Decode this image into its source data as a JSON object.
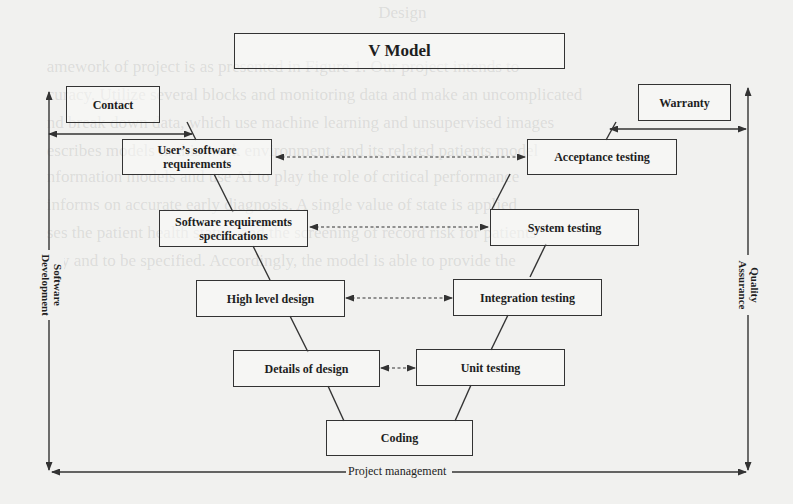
{
  "diagram": {
    "title": "V Model",
    "side_labels": {
      "left_line1": "Software",
      "left_line2": "Development",
      "right_line1": "Quality",
      "right_line2": "Assurance",
      "bottom": "Project management"
    },
    "external_boxes": {
      "contact": "Contact",
      "warranty": "Warranty"
    },
    "left_branch": [
      {
        "label_line1": "User’s software",
        "label_line2": "requirements"
      },
      {
        "label_line1": "Software requirements",
        "label_line2": "specifications"
      },
      {
        "label_line1": "High level design",
        "label_line2": ""
      },
      {
        "label_line1": "Details of design",
        "label_line2": ""
      }
    ],
    "bottom_node": "Coding",
    "right_branch": [
      {
        "label": "Acceptance testing"
      },
      {
        "label": "System testing"
      },
      {
        "label": "Integration testing"
      },
      {
        "label": "Unit testing"
      }
    ],
    "connections": [
      {
        "from": "User’s software requirements",
        "to": "Acceptance testing",
        "style": "dashed-bidirectional"
      },
      {
        "from": "Software requirements specifications",
        "to": "System testing",
        "style": "dashed-bidirectional"
      },
      {
        "from": "High level design",
        "to": "Integration testing",
        "style": "dashed-bidirectional"
      },
      {
        "from": "Details of design",
        "to": "Unit testing",
        "style": "dashed-bidirectional"
      }
    ],
    "colors": {
      "line": "#333333",
      "background": "#f1f1ef",
      "text": "#1e1e1e"
    }
  },
  "background_text": {
    "lines": [
      "                                                                                         Design",
      "",
      "           amework of project is as presented in Figure 1. Our project intends to",
      "           curacy. Utilize several blocks and monitoring data and make an uncomplicated",
      "           nd break down data, which use machine learning and unsupervised images",
      "           escribes models in this work environment, and its related patients model",
      "           nformation models and use AI to play the role of critical performance",
      "           informs on accurate early diagnosis. A single value of state is applied",
      "           ses the patient health status, and the screening of record risk for patients",
      "           ory and to be specified. Accordingly, the model is able to provide the"
    ]
  }
}
